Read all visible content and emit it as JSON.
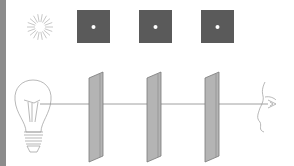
{
  "diagram": {
    "title": "",
    "colors": {
      "screen_fill": "#5a5a5a",
      "aperture": "#ffffff",
      "panel_fill": "#b4b4b4",
      "panel_edge": "#7a7a7a",
      "line": "#888888",
      "sketch": "#9a9a9a",
      "edge_bar": "#8c8c8c"
    },
    "top_row": [
      {
        "kind": "starburst",
        "label": ""
      },
      {
        "kind": "pinhole-view",
        "label": ""
      },
      {
        "kind": "pinhole-view",
        "label": ""
      },
      {
        "kind": "pinhole-view",
        "label": ""
      }
    ],
    "bottom_row": [
      {
        "kind": "light-bulb"
      },
      {
        "kind": "pinhole-panel"
      },
      {
        "kind": "pinhole-panel"
      },
      {
        "kind": "pinhole-panel"
      },
      {
        "kind": "eye-profile"
      }
    ]
  }
}
